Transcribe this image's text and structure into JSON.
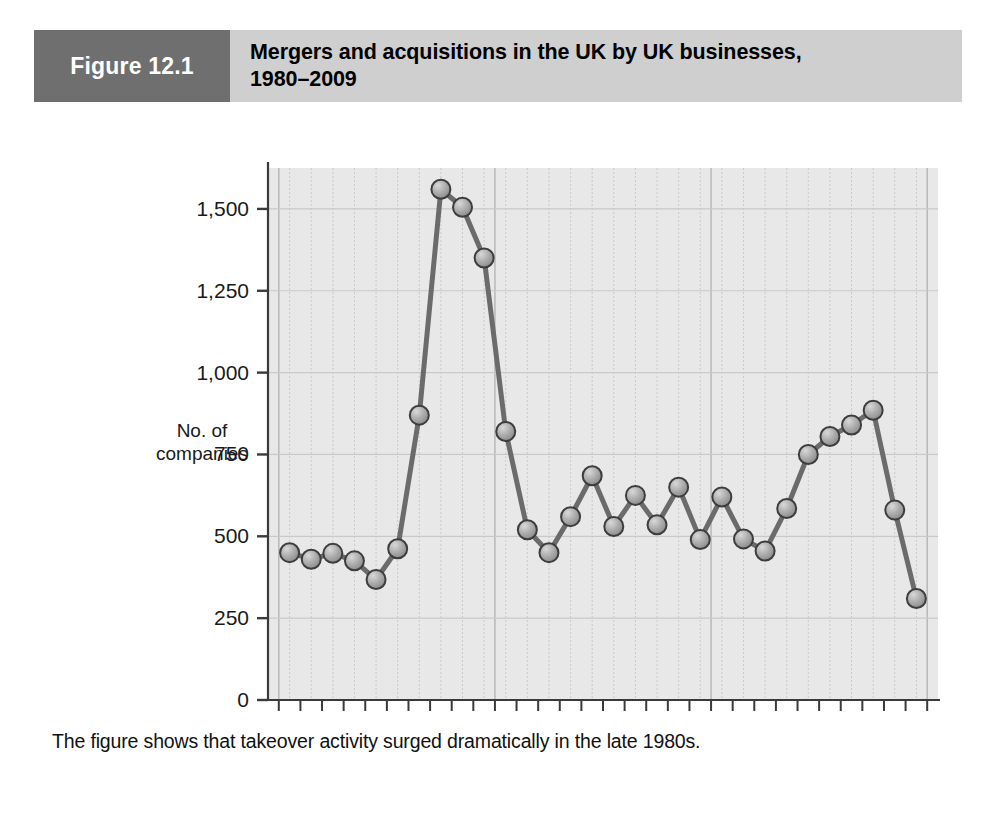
{
  "figure": {
    "number_label": "Figure 12.1",
    "title_line1": "Mergers and acquisitions in the UK by UK businesses,",
    "title_line2": "1980–2009",
    "caption": "The figure shows that takeover activity surged dramatically in the late 1980s."
  },
  "colors": {
    "header_number_bg": "#6f6f6f",
    "header_title_bg": "#cfcfcf",
    "plot_bg": "#e8e8e8",
    "gridline": "#c9c9c9",
    "axis": "#3a3a3a",
    "series_line": "#6b6b6b",
    "marker_fill": "#a8a8a8",
    "marker_edge": "#3d3d3d",
    "page_bg": "#ffffff",
    "text": "#111111"
  },
  "chart_data": {
    "type": "line",
    "title": "Mergers and acquisitions in the UK by UK businesses, 1980–2009",
    "xlabel": "Time (years 1980–2009)",
    "ylabel": "No. of companies",
    "ylabel_line1": "No. of",
    "ylabel_line2": "companies",
    "ylim": [
      0,
      1625
    ],
    "ytick_labels": [
      "0",
      "250",
      "500",
      "750",
      "1,000",
      "1,250",
      "1,500"
    ],
    "ytick_values": [
      0,
      250,
      500,
      750,
      1000,
      1250,
      1500
    ],
    "grid": true,
    "grid_axes": "both",
    "legend": false,
    "x_group_labels": [
      "1980–1989",
      "1990–1999",
      "2000–2009"
    ],
    "x_group_centers": [
      1984.5,
      1994.5,
      2004.5
    ],
    "x": [
      1980,
      1981,
      1982,
      1983,
      1984,
      1985,
      1986,
      1987,
      1988,
      1989,
      1990,
      1991,
      1992,
      1993,
      1994,
      1995,
      1996,
      1997,
      1998,
      1999,
      2000,
      2001,
      2002,
      2003,
      2004,
      2005,
      2006,
      2007,
      2008,
      2009
    ],
    "values": [
      450,
      430,
      448,
      425,
      368,
      462,
      870,
      1560,
      1505,
      1350,
      820,
      520,
      450,
      560,
      685,
      530,
      625,
      535,
      650,
      490,
      620,
      492,
      455,
      585,
      750,
      805,
      840,
      885,
      580,
      310
    ],
    "n_points": 30,
    "marker": "circle",
    "annotations": []
  }
}
